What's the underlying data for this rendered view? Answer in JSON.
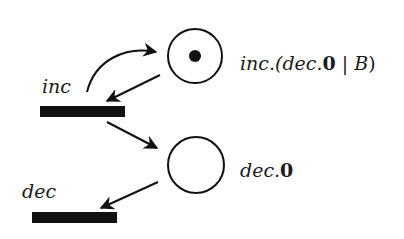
{
  "diagram": {
    "type": "petri-net",
    "places": [
      {
        "id": "p1",
        "label_parts": [
          "inc.(dec.",
          "0",
          " | ",
          "B",
          ")"
        ],
        "tokens": 1
      },
      {
        "id": "p2",
        "label_parts": [
          "dec.",
          "0"
        ],
        "tokens": 0
      }
    ],
    "transitions": [
      {
        "id": "t1",
        "label": "inc"
      },
      {
        "id": "t2",
        "label": "dec"
      }
    ],
    "arcs": [
      {
        "from": "t1",
        "to": "p1"
      },
      {
        "from": "p1",
        "to": "t1"
      },
      {
        "from": "t1",
        "to": "p2"
      },
      {
        "from": "p2",
        "to": "t2"
      }
    ],
    "colors": {
      "ink": "#111111",
      "background": "#ffffff"
    }
  }
}
